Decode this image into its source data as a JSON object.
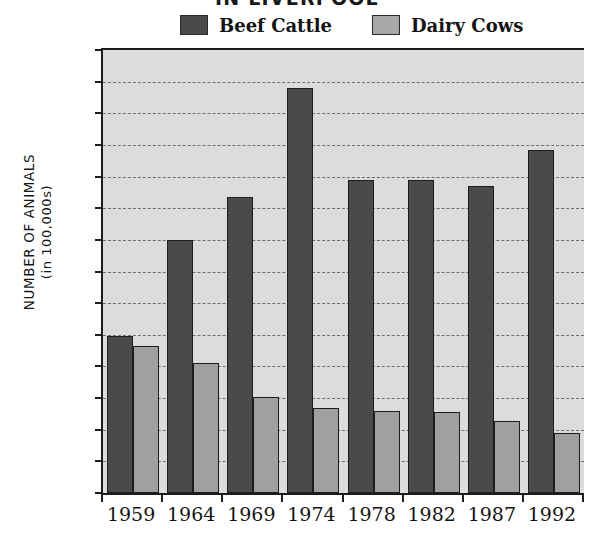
{
  "chart_data": {
    "type": "bar",
    "title": "IN LIVERPOOL",
    "xlabel": "",
    "ylabel": "NUMBER OF ANIMALS (in 100,000s)",
    "ylabel_line1": "NUMBER OF ANIMALS",
    "ylabel_line2": "(in 100,000s)",
    "categories": [
      "1959",
      "1964",
      "1969",
      "1974",
      "1978",
      "1982",
      "1987",
      "1992"
    ],
    "series": [
      {
        "name": "Beef Cattle",
        "color": "#4a4a4a",
        "values": [
          4.95,
          8.0,
          9.35,
          12.8,
          9.9,
          9.9,
          9.7,
          10.85
        ]
      },
      {
        "name": "Dairy Cows",
        "color": "#a0a0a0",
        "values": [
          4.65,
          4.1,
          3.05,
          2.7,
          2.6,
          2.55,
          2.28,
          1.9
        ]
      }
    ],
    "ylim": [
      0,
      14
    ],
    "y_ticks": [
      0,
      1,
      2,
      3,
      4,
      5,
      6,
      7,
      8,
      9,
      10,
      11,
      12,
      13,
      14
    ],
    "y_tick_labels": [
      "0",
      "1",
      "2",
      "3",
      "4",
      "5",
      "6",
      "7",
      "8",
      "9",
      "10",
      "11",
      "12",
      "13",
      "14"
    ],
    "grid": true,
    "grid_style": "dashed",
    "legend_position": "top",
    "plot_background": "#dcdcdc",
    "axis_color": "#1d1d1d"
  }
}
